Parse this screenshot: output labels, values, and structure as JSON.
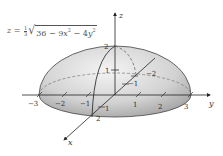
{
  "figure": {
    "equation": {
      "lhs": "z",
      "equals": "=",
      "coef_num": "1",
      "coef_den": "3",
      "radicand_const": "36",
      "minus1": "−",
      "term_x_coef": "9",
      "term_x_var": "x",
      "term_x_exp": "2",
      "minus2": "−",
      "term_y_coef": "4",
      "term_y_var": "y",
      "term_y_exp": "2"
    },
    "axes": {
      "x_label": "x",
      "y_label": "y",
      "z_label": "z"
    },
    "ticks": {
      "y": [
        "−3",
        "−2",
        "−1",
        "1",
        "2",
        "3"
      ],
      "x": [
        "−2",
        "−1",
        "1",
        "2"
      ],
      "z": [
        "1",
        "2"
      ]
    },
    "colors": {
      "surface_light": "#f2f2f2",
      "surface_dark": "#a9a9a9",
      "line": "#333333",
      "dashed": "#777777",
      "text": "#333333"
    }
  }
}
